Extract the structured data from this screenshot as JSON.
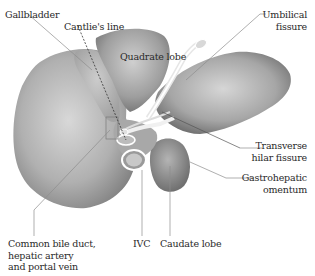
{
  "labels": {
    "gallbladder": "Gallbladder",
    "cantlies_line": "Cantlie's line",
    "quadrate_lobe": "Quadrate lobe",
    "umbilical_fissure_1": "Umbilical",
    "umbilical_fissure_2": "fissure",
    "transverse_hilar_1": "Transverse",
    "transverse_hilar_2": "hilar fissure",
    "gastrohepatic_1": "Gastrohepatic",
    "gastrohepatic_2": "omentum",
    "common_bile_1": "Common bile duct,",
    "common_bile_2": "hepatic artery",
    "common_bile_3": "and portal vein",
    "ivc": "IVC",
    "caudate_lobe": "Caudate lobe"
  },
  "colors": {
    "organ_light": "#d4d4d4",
    "organ_dark": "#8a8a8a",
    "leader_line": "#8c8c8c",
    "text": "#2a2a2a"
  }
}
